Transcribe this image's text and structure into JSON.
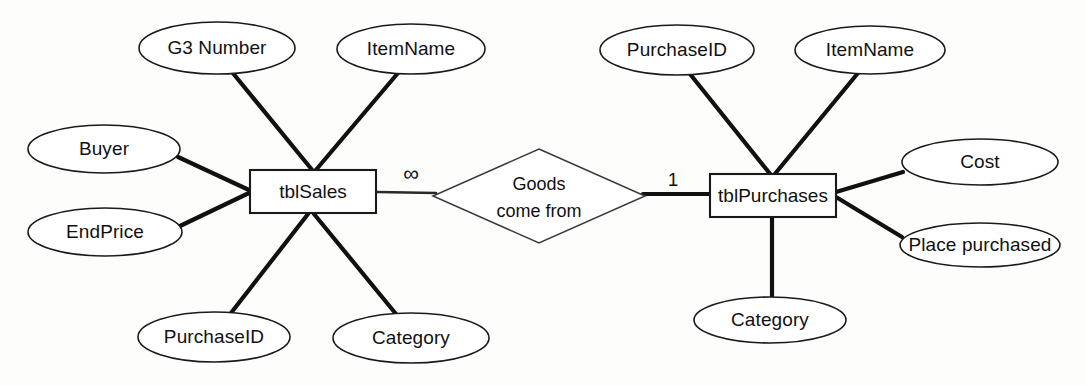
{
  "diagram": {
    "type": "entity-relationship-diagram",
    "background_color": "#fdfdfc",
    "line_color": "#111111",
    "shape_fill": "#ffffff",
    "entities": [
      {
        "id": "tblSales",
        "label": "tblSales",
        "x": 250,
        "y": 170,
        "w": 126,
        "h": 43
      },
      {
        "id": "tblPurchases",
        "label": "tblPurchases",
        "x": 710,
        "y": 174,
        "w": 126,
        "h": 43
      }
    ],
    "relationship": {
      "id": "goods-come-from",
      "line1": "Goods",
      "line2": "come from",
      "cx": 539,
      "cy": 196,
      "rx": 106,
      "ry": 47
    },
    "cardinalities": [
      {
        "id": "left-cardinality",
        "label": "∞",
        "x": 411,
        "y": 175,
        "side": "left"
      },
      {
        "id": "right-cardinality",
        "label": "1",
        "x": 673,
        "y": 180,
        "side": "right"
      }
    ],
    "attributes": [
      {
        "id": "sales-g3-number",
        "label": "G3 Number",
        "owner": "tblSales",
        "cx": 217,
        "cy": 48,
        "rx": 78,
        "ry": 26
      },
      {
        "id": "sales-itemname",
        "label": "ItemName",
        "owner": "tblSales",
        "cx": 411,
        "cy": 49,
        "rx": 74,
        "ry": 25
      },
      {
        "id": "sales-buyer",
        "label": "Buyer",
        "owner": "tblSales",
        "cx": 104,
        "cy": 149,
        "rx": 76,
        "ry": 24
      },
      {
        "id": "sales-endprice",
        "label": "EndPrice",
        "owner": "tblSales",
        "cx": 105,
        "cy": 232,
        "rx": 77,
        "ry": 24
      },
      {
        "id": "sales-purchaseid",
        "label": "PurchaseID",
        "owner": "tblSales",
        "cx": 214,
        "cy": 337,
        "rx": 76,
        "ry": 25
      },
      {
        "id": "sales-category",
        "label": "Category",
        "owner": "tblSales",
        "cx": 411,
        "cy": 338,
        "rx": 78,
        "ry": 25
      },
      {
        "id": "purch-purchaseid",
        "label": "PurchaseID",
        "owner": "tblPurchases",
        "cx": 677,
        "cy": 50,
        "rx": 77,
        "ry": 25
      },
      {
        "id": "purch-itemname",
        "label": "ItemName",
        "owner": "tblPurchases",
        "cx": 870,
        "cy": 50,
        "rx": 75,
        "ry": 24
      },
      {
        "id": "purch-cost",
        "label": "Cost",
        "owner": "tblPurchases",
        "cx": 980,
        "cy": 162,
        "rx": 78,
        "ry": 23
      },
      {
        "id": "purch-place",
        "label": "Place purchased",
        "owner": "tblPurchases",
        "cx": 980,
        "cy": 245,
        "rx": 80,
        "ry": 22
      },
      {
        "id": "purch-category",
        "label": "Category",
        "owner": "tblPurchases",
        "cx": 770,
        "cy": 320,
        "rx": 76,
        "ry": 23
      }
    ],
    "connectors": [
      {
        "id": "conn-g3-number",
        "from": "sales-g3-number",
        "to": "tblSales",
        "x1": 232,
        "y1": 72,
        "x2": 313,
        "y2": 171
      },
      {
        "id": "conn-sales-itemname",
        "from": "sales-itemname",
        "to": "tblSales",
        "x1": 398,
        "y1": 73,
        "x2": 315,
        "y2": 171
      },
      {
        "id": "conn-buyer",
        "from": "sales-buyer",
        "to": "tblSales",
        "x1": 178,
        "y1": 157,
        "x2": 249,
        "y2": 190
      },
      {
        "id": "conn-endprice",
        "from": "sales-endprice",
        "to": "tblSales",
        "x1": 180,
        "y1": 226,
        "x2": 249,
        "y2": 193
      },
      {
        "id": "conn-sales-purchid",
        "from": "sales-purchaseid",
        "to": "tblSales",
        "x1": 231,
        "y1": 313,
        "x2": 308,
        "y2": 214
      },
      {
        "id": "conn-sales-category",
        "from": "sales-category",
        "to": "tblSales",
        "x1": 396,
        "y1": 314,
        "x2": 314,
        "y2": 214
      },
      {
        "id": "conn-sales-rel",
        "from": "tblSales",
        "to": "goods-come-from",
        "x1": 377,
        "y1": 192,
        "x2": 434,
        "y2": 193
      },
      {
        "id": "conn-rel-purch",
        "from": "goods-come-from",
        "to": "tblPurchases",
        "x1": 645,
        "y1": 194,
        "x2": 709,
        "y2": 194
      },
      {
        "id": "conn-purch-purchid",
        "from": "purch-purchaseid",
        "to": "tblPurchases",
        "x1": 690,
        "y1": 74,
        "x2": 771,
        "y2": 175
      },
      {
        "id": "conn-purch-itemname",
        "from": "purch-itemname",
        "to": "tblPurchases",
        "x1": 858,
        "y1": 73,
        "x2": 774,
        "y2": 175
      },
      {
        "id": "conn-purch-cost",
        "from": "purch-cost",
        "to": "tblPurchases",
        "x1": 903,
        "y1": 172,
        "x2": 836,
        "y2": 192
      },
      {
        "id": "conn-purch-place",
        "from": "purch-place",
        "to": "tblPurchases",
        "x1": 902,
        "y1": 237,
        "x2": 836,
        "y2": 197
      },
      {
        "id": "conn-purch-category",
        "from": "purch-category",
        "to": "tblPurchases",
        "x1": 772,
        "y1": 297,
        "x2": 772,
        "y2": 217
      }
    ]
  }
}
